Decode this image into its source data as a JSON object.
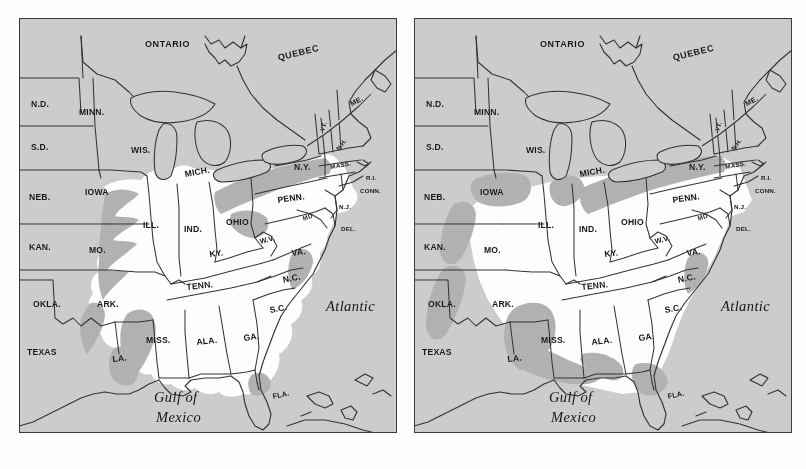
{
  "figure": {
    "kind": "two-panel-range-map",
    "region": "Eastern North America",
    "panel_count": 2,
    "colors": {
      "background_gray": "#c9c9c9",
      "range_white": "#fdfdfd",
      "transition_gray": "#a9a9a9",
      "outline_black": "#2b2b2b",
      "page_white": "#ffffff"
    }
  },
  "panels": [
    {
      "id": "left",
      "name": "left-map-panel"
    },
    {
      "id": "right",
      "name": "right-map-panel"
    }
  ],
  "labels": {
    "provinces": [
      {
        "text": "ONTARIO",
        "x": 126,
        "y": 22
      },
      {
        "text": "QUEBEC",
        "x": 258,
        "y": 36,
        "rot": -14
      }
    ],
    "states": [
      {
        "text": "N.D.",
        "x": 12,
        "y": 82
      },
      {
        "text": "MINN.",
        "x": 60,
        "y": 90
      },
      {
        "text": "S.D.",
        "x": 12,
        "y": 125
      },
      {
        "text": "WIS.",
        "x": 112,
        "y": 128
      },
      {
        "text": "MICH.",
        "x": 165,
        "y": 152,
        "rot": -10
      },
      {
        "text": "ME.",
        "x": 330,
        "y": 83,
        "rot": -28,
        "size": "sm"
      },
      {
        "text": "VT.",
        "x": 300,
        "y": 112,
        "rot": -70,
        "size": "xs"
      },
      {
        "text": "N.H.",
        "x": 316,
        "y": 130,
        "rot": -52,
        "size": "xs"
      },
      {
        "text": "N.Y.",
        "x": 275,
        "y": 145
      },
      {
        "text": "MASS.",
        "x": 311,
        "y": 146,
        "rot": -10,
        "size": "xs"
      },
      {
        "text": "R.I.",
        "x": 347,
        "y": 157,
        "size": "xs"
      },
      {
        "text": "CONN.",
        "x": 341,
        "y": 170,
        "size": "xs"
      },
      {
        "text": "NEB.",
        "x": 10,
        "y": 175
      },
      {
        "text": "IOWA",
        "x": 66,
        "y": 170
      },
      {
        "text": "PENN.",
        "x": 258,
        "y": 178,
        "rot": -8
      },
      {
        "text": "N.J.",
        "x": 320,
        "y": 186,
        "size": "xs"
      },
      {
        "text": "ILL.",
        "x": 124,
        "y": 203
      },
      {
        "text": "IND.",
        "x": 165,
        "y": 207
      },
      {
        "text": "OHIO",
        "x": 207,
        "y": 200
      },
      {
        "text": "MD",
        "x": 283,
        "y": 198,
        "rot": -18,
        "size": "xs"
      },
      {
        "text": "DEL.",
        "x": 322,
        "y": 208,
        "size": "xs"
      },
      {
        "text": "KAN.",
        "x": 10,
        "y": 225
      },
      {
        "text": "MO.",
        "x": 70,
        "y": 228
      },
      {
        "text": "KY.",
        "x": 190,
        "y": 232,
        "rot": -6
      },
      {
        "text": "W.V.",
        "x": 240,
        "y": 220,
        "rot": -14,
        "size": "sm"
      },
      {
        "text": "VA.",
        "x": 272,
        "y": 231,
        "rot": -8
      },
      {
        "text": "TENN.",
        "x": 167,
        "y": 265,
        "rot": -6
      },
      {
        "text": "N.C.",
        "x": 263,
        "y": 258,
        "rot": -12
      },
      {
        "text": "OKLA.",
        "x": 14,
        "y": 282
      },
      {
        "text": "ARK.",
        "x": 78,
        "y": 282
      },
      {
        "text": "S.C.",
        "x": 250,
        "y": 288,
        "rot": -10
      },
      {
        "text": "MISS.",
        "x": 127,
        "y": 318
      },
      {
        "text": "ALA.",
        "x": 177,
        "y": 320,
        "rot": -6
      },
      {
        "text": "GA.",
        "x": 224,
        "y": 316,
        "rot": -8
      },
      {
        "text": "TEXAS",
        "x": 8,
        "y": 330
      },
      {
        "text": "LA.",
        "x": 93,
        "y": 337,
        "rot": -6
      },
      {
        "text": "FLA.",
        "x": 253,
        "y": 375,
        "rot": -12,
        "size": "sm"
      }
    ],
    "oceans": [
      {
        "text": "Atlantic",
        "x": 307,
        "y": 281
      },
      {
        "text": "Gulf of",
        "x": 135,
        "y": 372
      },
      {
        "text": "Mexico",
        "x": 137,
        "y": 392
      }
    ]
  },
  "chart_data": {
    "type": "map",
    "title": "",
    "panels": [
      {
        "panel": "left",
        "legend": {
          "range_white": "species range (white)",
          "outside_gray": "outside range (gray)",
          "transition_gray": "peripheral / transition zone (mid-gray)"
        },
        "range_states_core": [
          "ILL.",
          "IND.",
          "OHIO",
          "MO.",
          "KY.",
          "TENN.",
          "ARK.",
          "MISS.",
          "ALA.",
          "GA.",
          "S.C.",
          "N.C.",
          "VA.",
          "W.V.",
          "PENN.",
          "N.Y.",
          "LA.",
          "IOWA",
          "MD",
          "DEL.",
          "N.J.",
          "CONN.",
          "MASS."
        ],
        "outside_range_states": [
          "N.D.",
          "S.D.",
          "MINN.",
          "WIS.",
          "MICH.",
          "NEB.",
          "KAN.",
          "OKLA.",
          "TEXAS",
          "ME.",
          "VT.",
          "N.H.",
          "FLA.",
          "ONTARIO",
          "QUEBEC"
        ],
        "transition_zone_states": [
          "IOWA",
          "MO.",
          "OKLA.",
          "TEXAS",
          "MISS.",
          "LA.",
          "N.Y.",
          "PENN.",
          "OHIO",
          "W.V.",
          "VA.",
          "N.C.",
          "S.C.",
          "FLA."
        ],
        "western_range_limit_note": "range edge lies in eastern Iowa / western Missouri / eastern Texas"
      },
      {
        "panel": "right",
        "legend": {
          "range_white": "species range (white)",
          "outside_gray": "outside range (gray)",
          "transition_gray": "peripheral / transition zone (mid-gray)"
        },
        "range_states_core": [
          "ILL.",
          "IND.",
          "OHIO",
          "MO.",
          "KY.",
          "TENN.",
          "ARK.",
          "MISS.",
          "ALA.",
          "GA.",
          "S.C.",
          "N.C.",
          "VA.",
          "W.V.",
          "PENN.",
          "N.Y.",
          "LA.",
          "IOWA",
          "MD",
          "DEL.",
          "N.J.",
          "CONN.",
          "MASS.",
          "KAN.",
          "OKLA."
        ],
        "outside_range_states": [
          "N.D.",
          "S.D.",
          "MINN.",
          "WIS.",
          "MICH.",
          "NEB.",
          "TEXAS",
          "ME.",
          "VT.",
          "N.H.",
          "FLA.",
          "ONTARIO",
          "QUEBEC"
        ],
        "transition_zone_states": [
          "IOWA",
          "NEB.",
          "KAN.",
          "OKLA.",
          "TEXAS",
          "MISS.",
          "ALA.",
          "LA.",
          "ARK.",
          "N.Y.",
          "MICH.",
          "FLA.",
          "S.C."
        ],
        "western_range_limit_note": "range expanded westward into Kansas, Oklahoma and east Texas; gray transition band shifted west"
      }
    ],
    "difference_summary": "Right panel shows a broader white range reaching farther west (Kansas/Oklahoma/east Texas) and a wider mid-gray transition band through Mississippi-Alabama and the western plains than the left panel."
  }
}
